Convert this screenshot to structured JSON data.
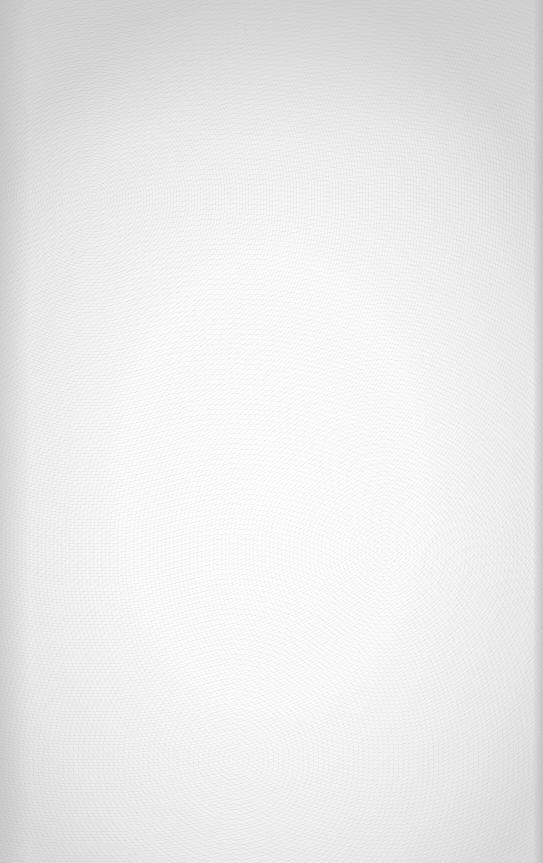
{
  "page": {
    "content": "",
    "background_color": "#f7f7f7",
    "edge_shade_color": "#d4d4d4"
  }
}
